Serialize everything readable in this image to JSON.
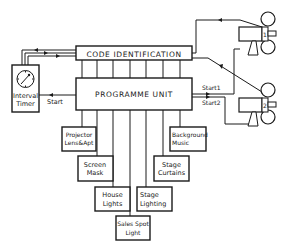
{
  "diagram": {
    "type": "block-diagram",
    "code_identification": {
      "label": "CODE   IDENTIFICATION"
    },
    "programme_unit": {
      "label": "PROGRAMME UNIT"
    },
    "interval_timer": {
      "line1": "Interval",
      "line2": "Timer",
      "icon": "clock-dial-icon"
    },
    "timer_link": {
      "label": "Start"
    },
    "projector_links": {
      "start1": "Start1",
      "start2": "Start2"
    },
    "projectors": [
      {
        "number": "1",
        "icon": "film-projector-icon"
      },
      {
        "number": "2",
        "icon": "film-projector-icon"
      }
    ],
    "outputs": [
      {
        "line1": "Projector",
        "line2": "Lens&Apt"
      },
      {
        "line1": "Screen",
        "line2": "Mask"
      },
      {
        "line1": "House",
        "line2": "Lights"
      },
      {
        "line1": "Sales Spot",
        "line2": "Light"
      },
      {
        "line1": "Stage",
        "line2": "Lighting"
      },
      {
        "line1": "Stage",
        "line2": "Curtains"
      },
      {
        "line1": "Background",
        "line2": "Music"
      }
    ],
    "colors": {
      "line": "#1a1a1a",
      "background": "#ffffff"
    }
  }
}
